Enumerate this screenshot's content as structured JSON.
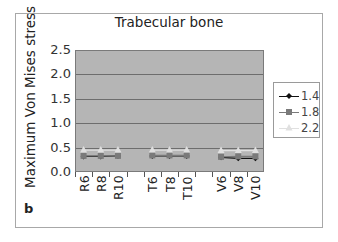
{
  "chart_data": {
    "type": "line",
    "title": "Trabecular bone",
    "xlabel": "",
    "ylabel": "Maximum Von Mises stress",
    "panel_label": "b",
    "ylim": [
      0,
      2.5
    ],
    "yticks": [
      "0.0",
      "0.5",
      "1.0",
      "1.5",
      "2.0",
      "2.5"
    ],
    "grid": true,
    "legend_position": "right",
    "categories": [
      "R6",
      "R8",
      "R10",
      "",
      "T6",
      "T8",
      "T10",
      "",
      "V6",
      "V8",
      "V10"
    ],
    "series": [
      {
        "name": "1.4",
        "marker": "diamond",
        "color": "#111111",
        "values": [
          0.32,
          0.32,
          0.33,
          null,
          0.33,
          0.33,
          0.33,
          null,
          0.3,
          0.28,
          0.28
        ]
      },
      {
        "name": "1.8",
        "marker": "square",
        "color": "#7a7a7a",
        "values": [
          0.33,
          0.33,
          0.33,
          null,
          0.34,
          0.34,
          0.34,
          null,
          0.31,
          0.32,
          0.32
        ]
      },
      {
        "name": "2.2",
        "marker": "triangle",
        "color": "#e0e0e0",
        "values": [
          0.45,
          0.45,
          0.45,
          null,
          0.45,
          0.45,
          0.45,
          null,
          0.44,
          0.44,
          0.44
        ]
      }
    ]
  }
}
